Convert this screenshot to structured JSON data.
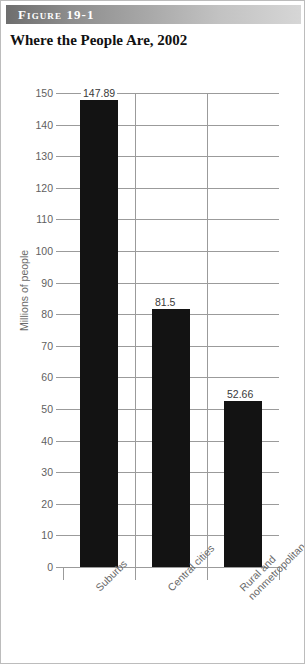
{
  "figure": {
    "header_label": "Figure 19-1",
    "title": "Where the People Are, 2002"
  },
  "chart_data": {
    "type": "bar",
    "title": "Where the People Are, 2002",
    "xlabel": "",
    "ylabel": "Millions of people",
    "ylim": [
      0,
      150
    ],
    "ytick_labels": [
      "150",
      "140",
      "130",
      "120",
      "110",
      "100",
      "90",
      "80",
      "70",
      "60",
      "50",
      "40",
      "30",
      "20",
      "10",
      "0"
    ],
    "ytick_values": [
      150,
      140,
      130,
      120,
      110,
      100,
      90,
      80,
      70,
      60,
      50,
      40,
      30,
      20,
      10,
      0
    ],
    "grid": true,
    "legend": "none",
    "categories": [
      "Suburbs",
      "Central cities",
      "Rural and nonmetropolitan"
    ],
    "category_label_lines": [
      [
        "Suburbs"
      ],
      [
        "Central cities"
      ],
      [
        "Rural and",
        "nonmetropolitan"
      ]
    ],
    "values": [
      147.89,
      81.5,
      52.66
    ],
    "value_labels": [
      "147.89",
      "81.5",
      "52.66"
    ],
    "bar_color": "#131313"
  },
  "colors": {
    "bar": "#131313",
    "grid": "#9b9b9b",
    "tick_text": "#5f5f5f",
    "label_text": "#6a6a6a",
    "header_start": "#6e6e6e",
    "header_end": "#d6d6d6"
  }
}
